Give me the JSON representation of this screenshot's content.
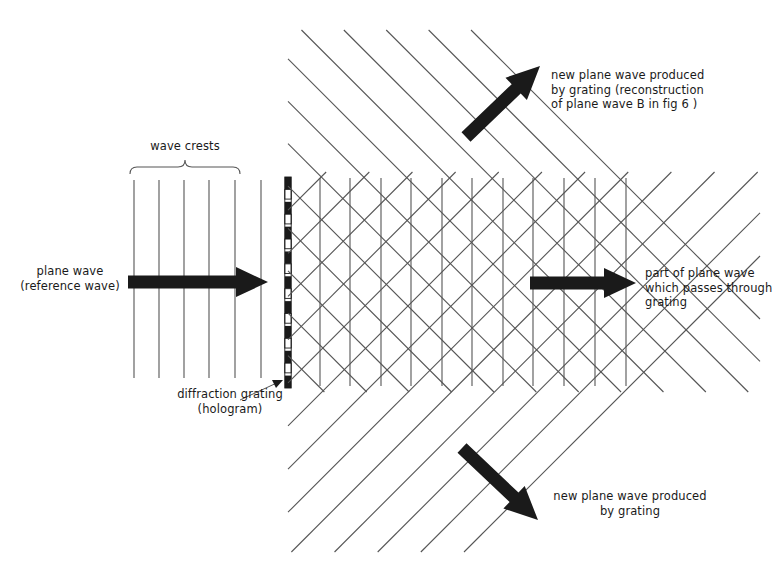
{
  "figure": {
    "ink_color": "#1a1a1a",
    "line_color": "#555555",
    "background": "#ffffff"
  },
  "labels": {
    "wave_crests": "wave crests",
    "plane_wave": "plane wave\n(reference wave)",
    "diffraction_grating": "diffraction grating\n(hologram)",
    "new_wave_up": "new plane wave produced\nby grating (reconstruction\nof plane wave B in fig 6 )",
    "through_grating": "part of plane wave\nwhich passes through\ngrating",
    "new_wave_down": "new plane wave produced\nby grating"
  },
  "arrows": {
    "incident": {
      "name": "incident-beam-arrow",
      "x1": 128,
      "y1": 282,
      "x2": 268,
      "y2": 282
    },
    "diffracted_up": {
      "name": "diffracted-up-arrow",
      "x1": 466,
      "y1": 137,
      "x2": 540,
      "y2": 66
    },
    "transmitted": {
      "name": "transmitted-beam-arrow",
      "x1": 530,
      "y1": 283,
      "x2": 636,
      "y2": 283
    },
    "diffracted_down": {
      "name": "diffracted-down-arrow",
      "x1": 462,
      "y1": 448,
      "x2": 538,
      "y2": 520
    }
  },
  "grating": {
    "x": 288,
    "y_top": 177,
    "y_bottom": 388,
    "segments": 17,
    "pointer": {
      "x1": 240,
      "y1": 400,
      "x2": 281,
      "y2": 381
    }
  },
  "brace": {
    "x_left": 130,
    "x_right": 240,
    "y": 168,
    "label_y": 146
  },
  "wavefronts": {
    "incident_vertical_x": [
      134,
      159,
      184,
      209,
      235,
      261
    ],
    "incident_y_top": 180,
    "incident_y_bottom": 378,
    "through_vertical_x": [
      320,
      350,
      381,
      411,
      442,
      472,
      503,
      533,
      564,
      595,
      626
    ],
    "through_y_top": 178,
    "through_y_bottom": 386,
    "diag_down_right_count": 13,
    "diag_up_right_count": 13,
    "angle_degrees": 45
  }
}
